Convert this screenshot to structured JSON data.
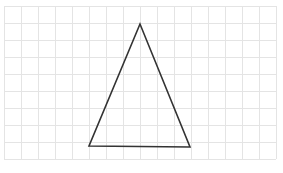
{
  "diagram": {
    "type": "triangle-on-grid",
    "grid": {
      "origin_x": 4,
      "origin_y": 6,
      "cell_size": 17,
      "columns": 16,
      "rows": 9,
      "line_color": "#e4e4e4"
    },
    "triangle": {
      "vertices": [
        {
          "name": "apex",
          "x": 140,
          "y": 24
        },
        {
          "name": "bottom-left",
          "x": 89,
          "y": 146
        },
        {
          "name": "bottom-right",
          "x": 190,
          "y": 147
        }
      ],
      "stroke_color": "#333333",
      "stroke_width": 1.6
    }
  }
}
